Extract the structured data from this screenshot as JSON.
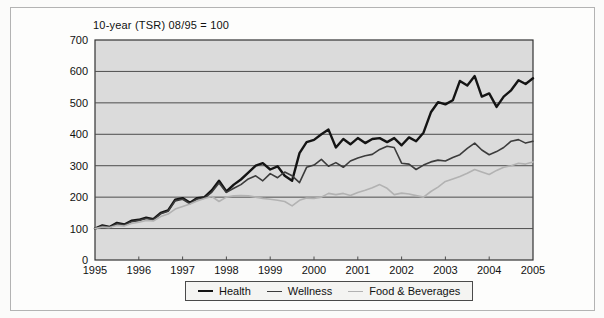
{
  "title": "10-year (TSR) 08/95 = 100",
  "colors": {
    "plot_background": "#dbdbdb",
    "plot_border": "#333333",
    "gridline": "#4d4d4d",
    "health_line": "#141414",
    "wellness_line": "#3c3c3c",
    "food_line": "#b2b2b2"
  },
  "legend": {
    "items": [
      {
        "label": "Health",
        "color": "#141414",
        "thickness": 2.4
      },
      {
        "label": "Wellness",
        "color": "#3c3c3c",
        "thickness": 1.6
      },
      {
        "label": "Food & Beverages",
        "color": "#b2b2b2",
        "thickness": 1.6
      }
    ]
  },
  "chart_data": {
    "type": "line",
    "title": "10-year (TSR) 08/95 = 100",
    "xlabel": "",
    "ylabel": "",
    "xlim": [
      1995,
      2005
    ],
    "ylim": [
      0,
      700
    ],
    "y_ticks": [
      0,
      100,
      200,
      300,
      400,
      500,
      600,
      700
    ],
    "x_ticks": [
      1995,
      1996,
      1997,
      1998,
      1999,
      2000,
      2001,
      2002,
      2003,
      2004,
      2005
    ],
    "grid": true,
    "legend_position": "bottom",
    "x": [
      1995,
      1995.17,
      1995.33,
      1995.5,
      1995.67,
      1995.83,
      1996,
      1996.17,
      1996.33,
      1996.5,
      1996.67,
      1996.83,
      1997,
      1997.17,
      1997.33,
      1997.5,
      1997.67,
      1997.83,
      1998,
      1998.17,
      1998.33,
      1998.5,
      1998.67,
      1998.83,
      1999,
      1999.17,
      1999.33,
      1999.5,
      1999.67,
      1999.83,
      2000,
      2000.17,
      2000.33,
      2000.5,
      2000.67,
      2000.83,
      2001,
      2001.17,
      2001.33,
      2001.5,
      2001.67,
      2001.83,
      2002,
      2002.17,
      2002.33,
      2002.5,
      2002.67,
      2002.83,
      2003,
      2003.17,
      2003.33,
      2003.5,
      2003.67,
      2003.83,
      2004,
      2004.17,
      2004.33,
      2004.5,
      2004.67,
      2004.83,
      2005
    ],
    "series": [
      {
        "name": "Health",
        "color": "#141414",
        "thickness": 2.4,
        "values": [
          100,
          110,
          105,
          118,
          113,
          125,
          128,
          135,
          130,
          150,
          158,
          192,
          197,
          182,
          197,
          200,
          222,
          252,
          218,
          240,
          256,
          278,
          300,
          308,
          288,
          298,
          268,
          252,
          340,
          375,
          382,
          400,
          415,
          358,
          385,
          368,
          388,
          372,
          385,
          388,
          375,
          388,
          365,
          390,
          378,
          405,
          470,
          502,
          495,
          508,
          570,
          555,
          585,
          520,
          530,
          487,
          520,
          540,
          572,
          560,
          578
        ]
      },
      {
        "name": "Wellness",
        "color": "#3c3c3c",
        "thickness": 1.6,
        "values": [
          100,
          108,
          104,
          115,
          111,
          122,
          126,
          132,
          128,
          147,
          155,
          188,
          193,
          179,
          194,
          197,
          216,
          245,
          215,
          228,
          240,
          258,
          268,
          252,
          275,
          262,
          280,
          268,
          246,
          295,
          302,
          320,
          298,
          310,
          295,
          315,
          325,
          332,
          336,
          352,
          362,
          358,
          308,
          305,
          288,
          302,
          312,
          318,
          315,
          326,
          335,
          355,
          372,
          350,
          335,
          345,
          358,
          378,
          383,
          372,
          378
        ]
      },
      {
        "name": "Food & Beverages",
        "color": "#b2b2b2",
        "thickness": 1.6,
        "values": [
          100,
          105,
          103,
          110,
          108,
          116,
          120,
          126,
          124,
          138,
          146,
          162,
          170,
          178,
          188,
          196,
          202,
          186,
          200,
          204,
          205,
          204,
          200,
          196,
          193,
          190,
          186,
          172,
          190,
          197,
          196,
          200,
          212,
          208,
          212,
          205,
          215,
          222,
          230,
          240,
          228,
          208,
          213,
          210,
          205,
          200,
          218,
          232,
          250,
          258,
          266,
          276,
          288,
          280,
          272,
          285,
          295,
          300,
          308,
          305,
          312
        ]
      }
    ]
  },
  "layout_px": {
    "plot_left": 95,
    "plot_top": 40,
    "plot_width": 438,
    "plot_height": 220
  }
}
